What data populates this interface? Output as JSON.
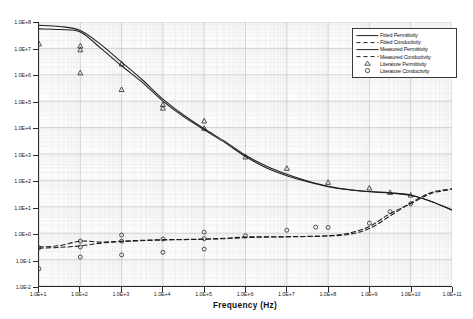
{
  "chart_data": {
    "type": "line",
    "title": "",
    "xlabel": "Frequency (Hz)",
    "ylabel": "",
    "xscale": "log",
    "yscale": "log",
    "xlim": [
      10,
      100000000000
    ],
    "ylim": [
      0.01,
      100000000
    ],
    "grid": true,
    "legend_position": "top-right",
    "xticks": [
      "1.0E+1",
      "1.0E+2",
      "1.0E+3",
      "1.0E+4",
      "1.0E+5",
      "1.0E+6",
      "1.0E+7",
      "1.0E+8",
      "1.0E+9",
      "1.0E+10",
      "1.0E+11"
    ],
    "yticks": [
      "1.0E+8",
      "1.0E+7",
      "1.0E+6",
      "1.0E+5",
      "1.0E+4",
      "1.0E+3",
      "1.0E+2",
      "1.0E+1",
      "1.0E+0",
      "1.0E-1",
      "1.0E-2"
    ],
    "series": [
      {
        "name": "Fitted Permittivity",
        "style": "solid",
        "marker": "none",
        "x": [
          10,
          31.6,
          100,
          316,
          1000,
          3160,
          10000,
          31600,
          100000,
          316000,
          1000000,
          3160000,
          10000000,
          31600000,
          100000000,
          316000000,
          1000000000,
          3160000000,
          10000000000,
          31600000000,
          100000000000
        ],
        "y": [
          75000000,
          68000000,
          48000000,
          14000000.0,
          3000000.0,
          650000.0,
          120000.0,
          30000.0,
          9000,
          3000,
          900,
          350,
          170,
          95,
          60,
          45,
          38,
          34,
          28,
          16,
          7.5
        ]
      },
      {
        "name": "Fitted Conductivity",
        "style": "dashed",
        "marker": "none",
        "x": [
          10,
          31.6,
          100,
          316,
          1000,
          3160,
          10000,
          31600,
          100000,
          316000,
          1000000,
          3160000,
          10000000,
          31600000,
          100000000,
          316000000,
          1000000000,
          3160000000,
          10000000000,
          31600000000,
          100000000000
        ],
        "y": [
          0.27,
          0.29,
          0.33,
          0.42,
          0.48,
          0.52,
          0.55,
          0.57,
          0.59,
          0.62,
          0.68,
          0.71,
          0.73,
          0.75,
          0.78,
          0.9,
          1.5,
          4.5,
          14,
          35,
          48
        ]
      },
      {
        "name": "Measured Permittivity",
        "style": "solid",
        "marker": "none",
        "x": [
          10,
          31.6,
          100,
          316,
          1000,
          3160,
          10000,
          31600,
          100000,
          316000,
          1000000,
          3160000,
          10000000,
          31600000,
          100000000,
          316000000,
          1000000000,
          3160000000,
          10000000000,
          31600000000,
          100000000000
        ],
        "y": [
          55000000,
          52000000,
          42000000.0,
          10000000.0,
          2200000.0,
          520000.0,
          100000.0,
          26000.0,
          8200,
          2700,
          800,
          300,
          150,
          88,
          58,
          44,
          37,
          33,
          27,
          16,
          7.5
        ]
      },
      {
        "name": "Measured Conductivity",
        "style": "dashed",
        "marker": "none",
        "x": [
          10,
          31.6,
          100,
          316,
          1000,
          3160,
          10000,
          31600,
          100000,
          316000,
          1000000,
          3160000,
          10000000,
          31600000,
          100000000,
          316000000,
          1000000000,
          3160000000,
          10000000000,
          31600000000,
          100000000000
        ],
        "y": [
          0.3,
          0.34,
          0.5,
          0.46,
          0.5,
          0.54,
          0.57,
          0.58,
          0.6,
          0.64,
          0.72,
          0.73,
          0.74,
          0.76,
          0.8,
          1.0,
          1.8,
          5.5,
          13,
          32,
          46
        ]
      },
      {
        "name": "Literature Permittivity",
        "style": "none",
        "marker": "triangle",
        "x": [
          10,
          100,
          100,
          100,
          1000,
          1000,
          10000,
          10000,
          100000,
          100000,
          1000000,
          10000000,
          100000000,
          1000000000,
          3160000000,
          10000000000
        ],
        "y": [
          15000000.0,
          12500000.0,
          9000000.0,
          1200000.0,
          2600000.0,
          280000.0,
          75000.0,
          55000.0,
          18000.0,
          9500,
          780,
          290,
          85,
          52,
          35,
          28
        ]
      },
      {
        "name": "Literature Conductivity",
        "style": "none",
        "marker": "circle",
        "x": [
          10,
          10,
          100,
          100,
          100,
          1000,
          1000,
          1000,
          10000,
          10000,
          100000,
          100000,
          100000,
          1000000,
          10000000,
          50000000,
          100000000,
          1000000000,
          3160000000,
          10000000000
        ],
        "y": [
          0.28,
          0.045,
          0.5,
          0.3,
          0.125,
          0.85,
          0.5,
          0.15,
          0.6,
          0.19,
          1.1,
          0.62,
          0.25,
          0.8,
          1.3,
          1.7,
          1.65,
          2.4,
          6.5,
          13
        ]
      }
    ]
  },
  "legend": {
    "entries": [
      {
        "label": "Fitted Permittivity",
        "key": "solid-line"
      },
      {
        "label": "Fitted Conductivity",
        "key": "dashed-line"
      },
      {
        "label": "Measured Permittivity",
        "key": "solid-line"
      },
      {
        "label": "Measured Conductivity",
        "key": "dashed-line"
      },
      {
        "label": "Literature Permittivity",
        "key": "triangle-marker"
      },
      {
        "label": "Literature Conductivity",
        "key": "circle-marker"
      }
    ]
  },
  "colors": {
    "axis": "#2b2b2b",
    "curve": "#1c1c1c",
    "grid_major": "#b9b9b9",
    "grid_minor": "#e3e3e3",
    "plot_bg": "#fbfbfb"
  }
}
